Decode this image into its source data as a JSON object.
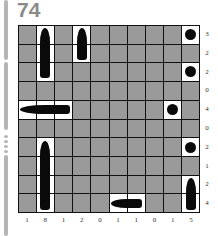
{
  "puzzle": {
    "number": "74",
    "type": "battleships",
    "rows": 10,
    "cols": 10,
    "row_clues": [
      "3",
      "2",
      "2",
      "0",
      "4",
      "0",
      "2",
      "1",
      "2",
      "4"
    ],
    "col_clues": [
      "1",
      "8",
      "1",
      "2",
      "0",
      "1",
      "1",
      "0",
      "1",
      "5"
    ],
    "colors": {
      "water": "#9a9a9a",
      "ship_cell": "#ffffff",
      "ship": "#0a0a0a",
      "grid_line": "#111111",
      "title": "#8a8a8a"
    },
    "ships": [
      {
        "kind": "vertical",
        "row": 1,
        "col": 2,
        "length": 3
      },
      {
        "kind": "vertical",
        "row": 1,
        "col": 4,
        "length": 2
      },
      {
        "kind": "sub",
        "row": 1,
        "col": 10,
        "length": 1
      },
      {
        "kind": "sub",
        "row": 3,
        "col": 10,
        "length": 1
      },
      {
        "kind": "horizontal",
        "row": 5,
        "col": 1,
        "length": 3
      },
      {
        "kind": "sub",
        "row": 5,
        "col": 9,
        "length": 1
      },
      {
        "kind": "vertical",
        "row": 7,
        "col": 2,
        "length": 4
      },
      {
        "kind": "sub",
        "row": 7,
        "col": 10,
        "length": 1
      },
      {
        "kind": "vertical",
        "row": 9,
        "col": 10,
        "length": 2
      },
      {
        "kind": "horizontal",
        "row": 10,
        "col": 6,
        "length": 2
      }
    ]
  }
}
